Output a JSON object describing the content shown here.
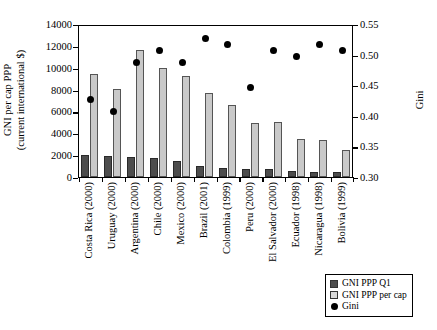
{
  "chart_data": {
    "type": "bar",
    "title": "",
    "subtitle": "",
    "xlabel": "",
    "ylabel": "GNI per cap PPP (current international $)",
    "ylabel_line1": "GNI per cap PPP",
    "ylabel_line2": "(current international $)",
    "y2label": "Gini",
    "ylim": [
      0,
      14000
    ],
    "y2lim": [
      0.3,
      0.55
    ],
    "yticks": [
      0,
      2000,
      4000,
      6000,
      8000,
      10000,
      12000,
      14000
    ],
    "ytick_labels": [
      "0",
      "2000",
      "4000",
      "6000",
      "8000",
      "10000",
      "12000",
      "14000"
    ],
    "y2ticks": [
      0.3,
      0.35,
      0.4,
      0.45,
      0.5,
      0.55
    ],
    "y2tick_labels": [
      "0.30",
      "0.35",
      "0.40",
      "0.45",
      "0.50",
      "0.55"
    ],
    "grid": false,
    "legend_position": "bottom-right",
    "categories": [
      "Costa Rica (2000)",
      "Uruguay (2000)",
      "Argentina (2000)",
      "Chile (2000)",
      "Mexico (2000)",
      "Brazil (2001)",
      "Colombia (1999)",
      "Peru (2000)",
      "El Salvador (2000)",
      "Ecuador (1998)",
      "Nicaragua (1998)",
      "Bolivia (1999)"
    ],
    "series": [
      {
        "name": "GNI PPP Q1",
        "axis": "left",
        "color": "#4d4d4d",
        "values": [
          1980,
          1950,
          1820,
          1720,
          1450,
          980,
          790,
          730,
          690,
          520,
          500,
          480
        ]
      },
      {
        "name": "GNI PPP per cap",
        "axis": "left",
        "color": "#c9c9c9",
        "values": [
          9450,
          8050,
          11600,
          10000,
          9200,
          7700,
          6550,
          4950,
          5050,
          3450,
          3350,
          2500
        ]
      },
      {
        "name": "Gini",
        "axis": "right",
        "color": "#000000",
        "marker": "circle",
        "values": [
          0.43,
          0.41,
          0.49,
          0.51,
          0.49,
          0.53,
          0.52,
          0.45,
          0.51,
          0.5,
          0.52,
          0.51
        ]
      }
    ]
  },
  "legend": {
    "items": [
      {
        "label": "GNI PPP Q1",
        "swatch": "q1"
      },
      {
        "label": "GNI PPP per cap",
        "swatch": "percap"
      },
      {
        "label": "Gini",
        "swatch": "gini"
      }
    ]
  },
  "caption": {
    "text": ""
  }
}
